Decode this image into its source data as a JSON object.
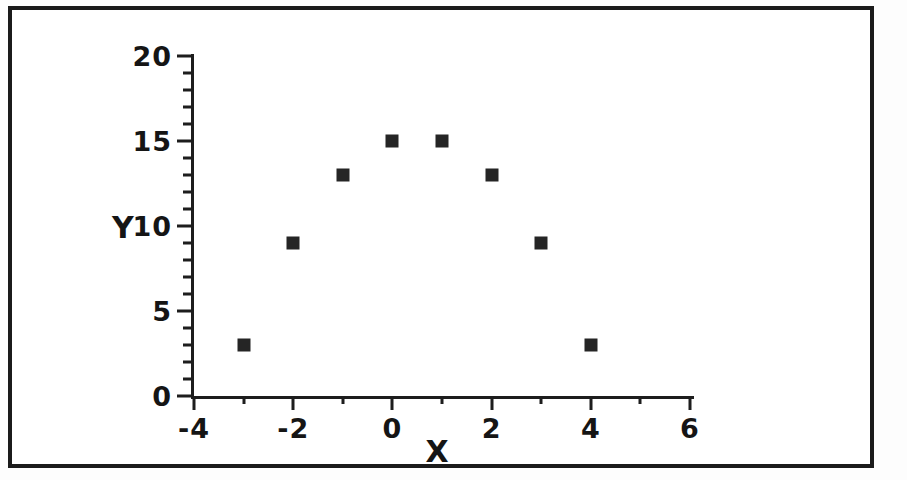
{
  "figure": {
    "frame_color": "#1b1b1b",
    "background": "#ffffff"
  },
  "chart_data": {
    "type": "scatter",
    "title": "",
    "subtitle": "",
    "xlabel": "X",
    "ylabel": "Y",
    "x": [
      -3,
      -2,
      -1,
      0,
      1,
      2,
      3,
      4
    ],
    "values": [
      3,
      9,
      13,
      15,
      15,
      13,
      9,
      3
    ],
    "series": [
      {
        "name": "",
        "x": [
          -3,
          -2,
          -1,
          0,
          1,
          2,
          3,
          4
        ],
        "values": [
          3,
          9,
          13,
          15,
          15,
          13,
          9,
          3
        ],
        "marker": "square",
        "marker_color": "#252525"
      }
    ],
    "xlim": [
      -4,
      6
    ],
    "ylim": [
      0,
      20
    ],
    "xticks": [
      -4,
      -2,
      0,
      2,
      4,
      6
    ],
    "xtick_labels": [
      "-4",
      "-2",
      "0",
      "2",
      "4",
      "6"
    ],
    "x_minor_tick_step": 1,
    "yticks": [
      0,
      5,
      10,
      15,
      20
    ],
    "ytick_labels": [
      "0",
      "5",
      "10",
      "15",
      "20"
    ],
    "y_minor_tick_step": 1,
    "grid": false,
    "legend": null,
    "legend_position": "none",
    "annotations": []
  }
}
